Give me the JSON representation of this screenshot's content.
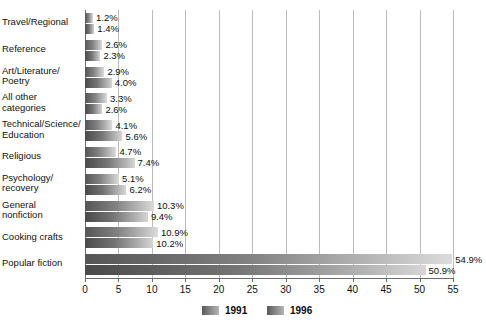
{
  "chart_data": {
    "type": "bar",
    "orientation": "horizontal",
    "title": "",
    "subtitle": "",
    "xlabel": "",
    "ylabel": "",
    "xlim": [
      0,
      55
    ],
    "xticks": [
      0,
      5,
      10,
      15,
      20,
      25,
      30,
      35,
      40,
      45,
      50,
      55
    ],
    "xtick_labels": [
      "0",
      "5",
      "10",
      "15",
      "20",
      "25",
      "30",
      "35",
      "40",
      "45",
      "50",
      "55"
    ],
    "grid": "vertical",
    "legend_position": "bottom-center",
    "value_suffix": "%",
    "categories": [
      "Travel/Regional",
      "Reference",
      "Art/Literature/\nPoetry",
      "All other\ncategories",
      "Technical/Science/\nEducation",
      "Religious",
      "Psychology/\nrecovery",
      "General\nnonfiction",
      "Cooking crafts",
      "Popular fiction"
    ],
    "series": [
      {
        "name": "1991",
        "color": "#7a7a7a",
        "values": [
          1.2,
          2.6,
          2.9,
          3.3,
          4.1,
          4.7,
          5.1,
          10.3,
          10.9,
          54.9
        ],
        "labels": [
          "1.2%",
          "2.6%",
          "2.9%",
          "3.3%",
          "4.1%",
          "4.7%",
          "5.1%",
          "10.3%",
          "10.9%",
          "54.9%"
        ]
      },
      {
        "name": "1996",
        "color": "#6e6e6e",
        "values": [
          1.4,
          2.3,
          4.0,
          2.6,
          5.6,
          7.4,
          6.2,
          9.4,
          10.2,
          50.9
        ],
        "labels": [
          "1.4%",
          "2.3%",
          "4.0%",
          "2.6%",
          "5.6%",
          "7.4%",
          "6.2%",
          "9.4%",
          "10.2%",
          "50.9%"
        ]
      }
    ]
  },
  "legend": {
    "entries": [
      {
        "label": "1991"
      },
      {
        "label": "1996"
      }
    ]
  }
}
